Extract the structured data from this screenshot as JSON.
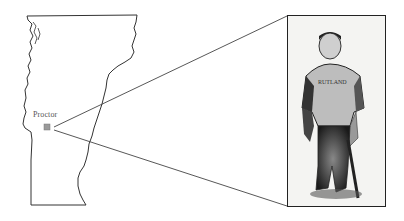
{
  "map": {
    "region": "Vermont",
    "location_label": "Proctor",
    "marker_icon": "town-marker-icon",
    "outline_color": "#333333",
    "marker_color": "#9a9a9a"
  },
  "photo": {
    "subject": "baseball player in uniform holding a bat",
    "style": "black-and-white halftone",
    "border_color": "#222222"
  },
  "connector_lines": {
    "color": "#444444",
    "from": "Proctor",
    "to": "photo"
  }
}
